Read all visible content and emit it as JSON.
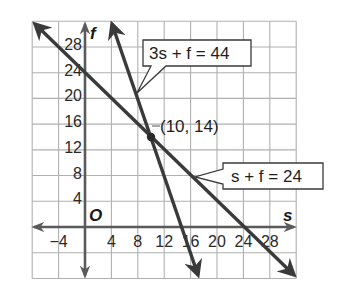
{
  "chart_data": {
    "type": "line",
    "title": "",
    "xlabel": "s",
    "ylabel": "f",
    "origin_label": "O",
    "xlim": [
      -8,
      32
    ],
    "ylim": [
      -8,
      32
    ],
    "grid": true,
    "grid_step": 4,
    "x_ticks": [
      -4,
      4,
      8,
      12,
      16,
      20,
      24,
      28
    ],
    "x_tick_labels": [
      "−4",
      "4",
      "8",
      "12",
      "16",
      "20",
      "24",
      "28"
    ],
    "y_ticks": [
      4,
      8,
      12,
      16,
      20,
      24,
      28
    ],
    "y_tick_labels": [
      "4",
      "8",
      "12",
      "16",
      "20",
      "24",
      "28"
    ],
    "series": [
      {
        "name": "s + f = 24",
        "label": "s + f = 24",
        "equation": {
          "a": 1,
          "b": 1,
          "c": 24
        },
        "x": [
          -8,
          32
        ],
        "y": [
          32,
          -8
        ],
        "arrows": "both"
      },
      {
        "name": "3s + f = 44",
        "label": "3s + f = 44",
        "equation": {
          "a": 3,
          "b": 1,
          "c": 44
        },
        "x": [
          4,
          17.33
        ],
        "y": [
          32,
          -8
        ],
        "arrows": "both"
      }
    ],
    "annotations": [
      {
        "type": "point",
        "x": 10,
        "y": 14,
        "label": "(10, 14)"
      },
      {
        "type": "callout",
        "text": "3s + f = 44",
        "target_series": "3s + f = 44"
      },
      {
        "type": "callout",
        "text": "s + f = 24",
        "target_series": "s + f = 24"
      }
    ]
  },
  "labels": {
    "f_axis": "f",
    "s_axis": "s",
    "origin": "O",
    "callout1": "3s + f = 44",
    "callout2": "s + f = 24",
    "point": "(10, 14)"
  },
  "colors": {
    "grid": "#a8a8a8",
    "axis": "#5a5a5a",
    "line": "#3a3a3a",
    "text": "#1e1e1e",
    "background": "#ffffff"
  }
}
